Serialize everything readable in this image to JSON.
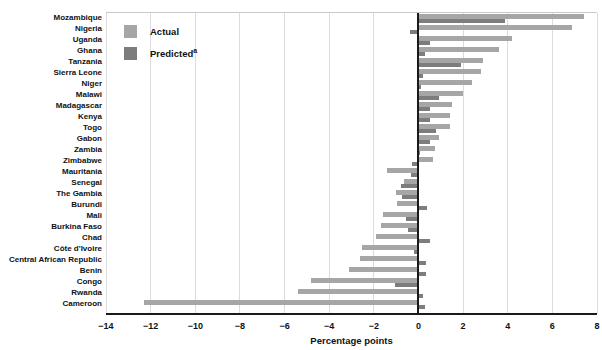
{
  "chart_data": {
    "type": "bar",
    "orientation": "horizontal",
    "title": "",
    "xlabel": "Percentage points",
    "xlim": [
      -14,
      8
    ],
    "xticks": [
      -14,
      -12,
      -10,
      -8,
      -6,
      -4,
      -2,
      0,
      2,
      4,
      6,
      8
    ],
    "xtick_labels": [
      "−14",
      "−12",
      "−10",
      "−8",
      "−6",
      "−4",
      "−2",
      "0",
      "2",
      "4",
      "6",
      "8"
    ],
    "grid": "vertical-light",
    "legend_position": "top-left-inside",
    "categories": [
      "Mozambique",
      "Nigeria",
      "Uganda",
      "Ghana",
      "Tanzania",
      "Sierra Leone",
      "Niger",
      "Malawi",
      "Madagascar",
      "Kenya",
      "Togo",
      "Gabon",
      "Zambia",
      "Zimbabwe",
      "Mauritania",
      "Senegal",
      "The Gambia",
      "Burundi",
      "Mali",
      "Burkina Faso",
      "Chad",
      "Côte d'Ivoire",
      "Central African Republic",
      "Benin",
      "Congo",
      "Rwanda",
      "Cameroon"
    ],
    "series": [
      {
        "name": "Actual",
        "sup": "",
        "color": "#a6a6a6",
        "values": [
          7.4,
          6.9,
          4.2,
          3.6,
          2.9,
          2.8,
          2.4,
          2.0,
          1.5,
          1.4,
          1.4,
          0.9,
          0.75,
          0.65,
          -1.4,
          -0.65,
          -1.0,
          -0.95,
          -1.6,
          -1.7,
          -1.9,
          -2.55,
          -2.6,
          -3.1,
          -4.8,
          -5.4,
          -12.3
        ]
      },
      {
        "name": "Predicted",
        "sup": "a",
        "color": "#7d7d7d",
        "values": [
          3.9,
          -0.4,
          0.5,
          0.3,
          1.9,
          0.2,
          0.1,
          0.9,
          0.5,
          0.5,
          0.8,
          0.5,
          0.05,
          -0.3,
          -0.35,
          -0.8,
          -0.75,
          0.4,
          -0.55,
          -0.45,
          0.5,
          -0.2,
          0.35,
          0.35,
          -1.05,
          0.2,
          0.3
        ]
      }
    ]
  }
}
